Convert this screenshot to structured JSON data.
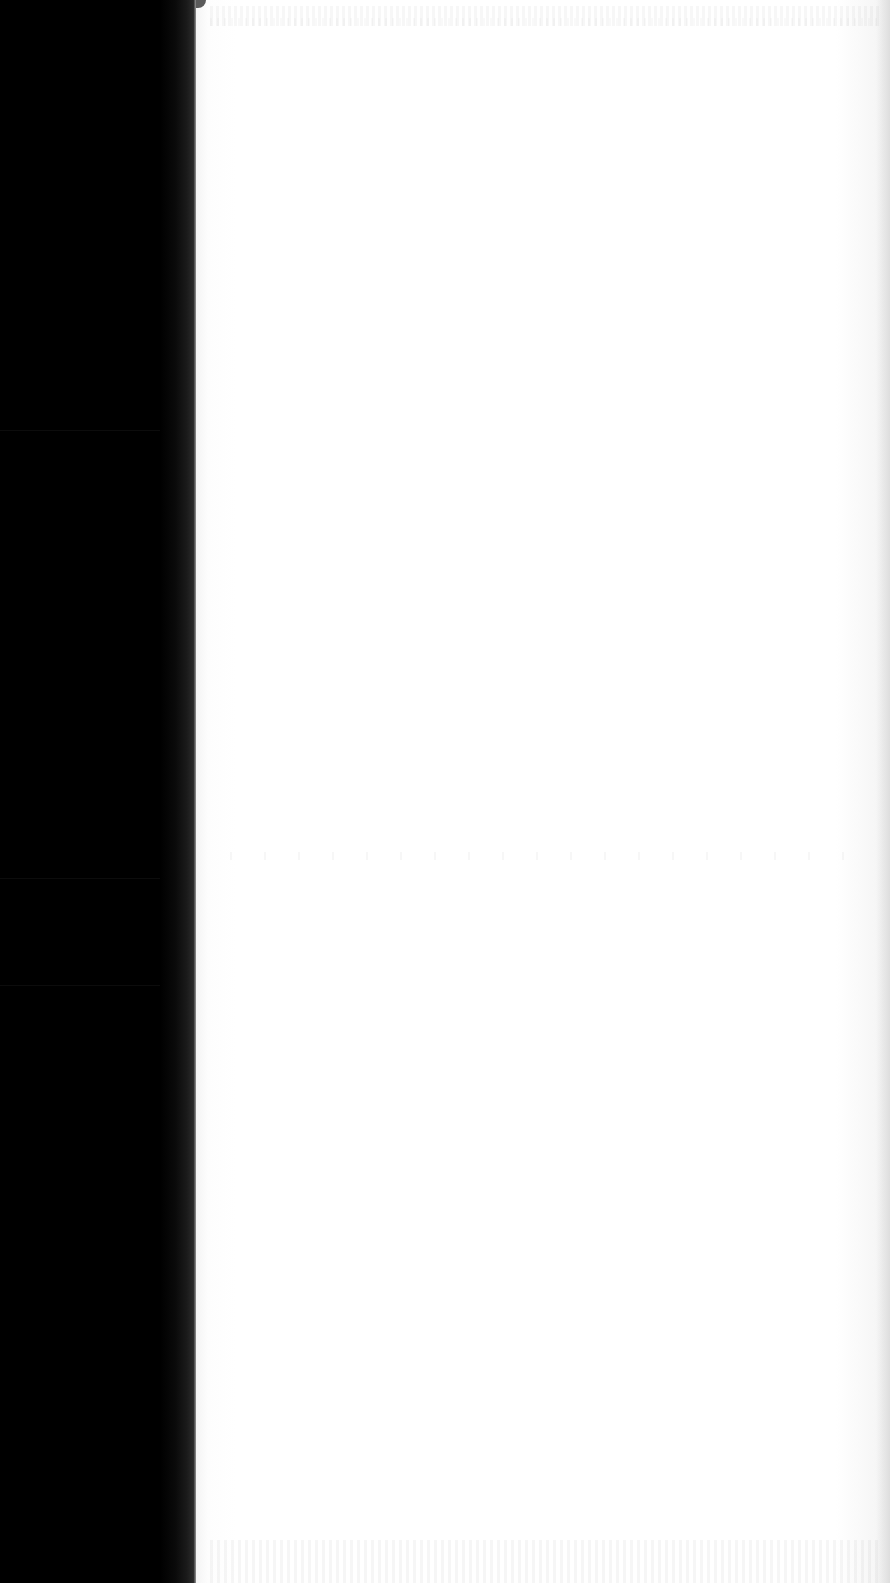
{
  "document": {
    "type": "scanned-page",
    "content_state": "blank page with illegible bleed-through",
    "visible_text": [],
    "regions": {
      "scanner_bed": {
        "color": "#000000",
        "x_range": [
          0,
          196
        ]
      },
      "page": {
        "color": "#ffffff",
        "x_range": [
          196,
          890
        ]
      },
      "ghost_text_bands": [
        {
          "position": "top",
          "y_range": [
            5,
            26
          ],
          "legible": false
        },
        {
          "position": "middle",
          "y_range": [
            850,
            862
          ],
          "legible": false
        },
        {
          "position": "bottom",
          "y_range": [
            1540,
            1583
          ],
          "legible": false
        }
      ],
      "bed_separator_lines_y": [
        430,
        878,
        985
      ]
    }
  }
}
